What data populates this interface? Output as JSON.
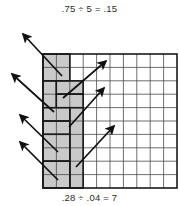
{
  "figure": {
    "type": "grid-division-model",
    "width": 179,
    "height": 206,
    "top_equation": ".75 ÷ 5 = .15",
    "bottom_equation": ".28 ÷ .04 = 7",
    "grid": {
      "rows": 10,
      "columns": 10,
      "x": 43,
      "y": 54,
      "cell_size": 13.4,
      "border_color": "#1a1a1a",
      "line_color": "#4a4a4a",
      "background": "#ffffff"
    },
    "shading": {
      "fill_color": "#c9c9c9",
      "stroke_color": "#1a1a1a",
      "label": "shaded-region"
    },
    "shaded_blocks": [
      {
        "name": "block-1",
        "col": 0,
        "row": 0,
        "cols": 2,
        "rows": 2
      },
      {
        "name": "block-2",
        "col": 0,
        "row": 2,
        "cols": 1,
        "rows": 2
      },
      {
        "name": "block-3",
        "col": 1,
        "row": 2,
        "cols": 2,
        "rows": 1
      },
      {
        "name": "block-4",
        "col": 1,
        "row": 3,
        "cols": 2,
        "rows": 1
      },
      {
        "name": "block-5",
        "col": 0,
        "row": 4,
        "cols": 2,
        "rows": 1
      },
      {
        "name": "block-6",
        "col": 0,
        "row": 5,
        "cols": 2,
        "rows": 1
      },
      {
        "name": "block-7",
        "col": 2,
        "row": 4,
        "cols": 1,
        "rows": 6
      },
      {
        "name": "block-8",
        "col": 0,
        "row": 6,
        "cols": 2,
        "rows": 2
      },
      {
        "name": "block-9",
        "col": 0,
        "row": 8,
        "cols": 2,
        "rows": 2
      }
    ],
    "arrows_outward": [
      {
        "name": "arrow-out-1",
        "x1": 62,
        "y1": 76,
        "x2": 23,
        "y2": 34
      },
      {
        "name": "arrow-out-2",
        "x1": 54,
        "y1": 112,
        "x2": 12,
        "y2": 74
      },
      {
        "name": "arrow-out-3",
        "x1": 58,
        "y1": 152,
        "x2": 20,
        "y2": 115
      },
      {
        "name": "arrow-out-4",
        "x1": 58,
        "y1": 180,
        "x2": 20,
        "y2": 142
      }
    ],
    "arrows_inward": [
      {
        "name": "arrow-in-1",
        "x1": 63,
        "y1": 98,
        "x2": 106,
        "y2": 61
      },
      {
        "name": "arrow-in-2",
        "x1": 69,
        "y1": 127,
        "x2": 104,
        "y2": 88
      },
      {
        "name": "arrow-in-3",
        "x1": 76,
        "y1": 167,
        "x2": 114,
        "y2": 126
      }
    ],
    "arrow_color": "#111111"
  }
}
